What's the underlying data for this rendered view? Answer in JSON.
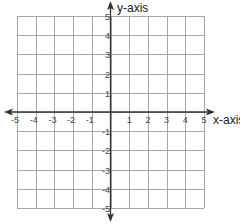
{
  "chart_data": {
    "type": "scatter",
    "title": "",
    "xlabel": "x-axis",
    "ylabel": "y-axis",
    "xlim": [
      -5,
      5
    ],
    "ylim": [
      -5,
      5
    ],
    "grid": true,
    "x_ticks": [
      "-5",
      "-4",
      "-3",
      "-2",
      "-1",
      "1",
      "2",
      "3",
      "4",
      "5"
    ],
    "y_ticks": [
      "5",
      "4",
      "3",
      "2",
      "1",
      "-1",
      "-2",
      "-3",
      "-4",
      "-5"
    ],
    "points": [],
    "colors": {
      "grid": "#a8a8a8",
      "axis": "#333333",
      "background": "#ffffff"
    }
  }
}
